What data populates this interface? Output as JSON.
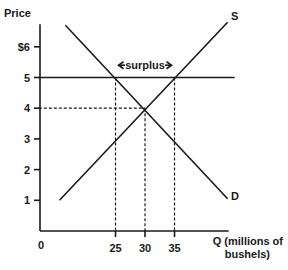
{
  "chart_data": {
    "type": "line",
    "title": "",
    "xlabel": "Q (millions of bushels)",
    "xlabel_lines": [
      "Q (millions of",
      "bushels)"
    ],
    "ylabel": "Price",
    "origin_label": "0",
    "xlim": [
      12,
      44
    ],
    "ylim": [
      0,
      6.8
    ],
    "grid": false,
    "y_ticks": [
      {
        "value": 1,
        "label": "1"
      },
      {
        "value": 2,
        "label": "2"
      },
      {
        "value": 3,
        "label": "3"
      },
      {
        "value": 4,
        "label": "4"
      },
      {
        "value": 5,
        "label": "5"
      },
      {
        "value": 6,
        "label": "$6"
      }
    ],
    "x_ticks": [
      {
        "value": 25,
        "label": "25"
      },
      {
        "value": 30,
        "label": "30"
      },
      {
        "value": 35,
        "label": "35"
      }
    ],
    "series": [
      {
        "name": "S",
        "label": "S",
        "points": [
          [
            15.5,
            1.0
          ],
          [
            44.0,
            6.8
          ]
        ]
      },
      {
        "name": "D",
        "label": "D",
        "points": [
          [
            16.5,
            6.7
          ],
          [
            44.0,
            1.05
          ]
        ]
      }
    ],
    "price_floor": {
      "price": 5,
      "q_start": 12,
      "q_end": 45.2
    },
    "equilibrium": {
      "q": 30,
      "price": 4
    },
    "dashed_guides": [
      {
        "type": "vertical",
        "q": 25,
        "from_price": 0,
        "to_price": 5
      },
      {
        "type": "vertical",
        "q": 30,
        "from_price": 0,
        "to_price": 4
      },
      {
        "type": "vertical",
        "q": 35,
        "from_price": 0,
        "to_price": 5
      },
      {
        "type": "horizontal",
        "price": 4,
        "from_q": 12,
        "to_q": 30
      }
    ],
    "annotations": [
      {
        "text": "surplus",
        "q_from": 25,
        "q_to": 35,
        "price": 5.4,
        "arrows": "both"
      }
    ]
  }
}
